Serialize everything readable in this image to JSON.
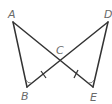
{
  "diagram": {
    "type": "geometry",
    "points": {
      "A": {
        "label": "A",
        "x": 13,
        "y": 22
      },
      "B": {
        "label": "B",
        "x": 27,
        "y": 87
      },
      "C": {
        "label": "C",
        "x": 60,
        "y": 61
      },
      "D": {
        "label": "D",
        "x": 108,
        "y": 22
      },
      "E": {
        "label": "E",
        "x": 93,
        "y": 87
      }
    },
    "segments": [
      "AB",
      "AE",
      "DB",
      "DE"
    ],
    "marks": {
      "congruent_segments": [
        "BC",
        "CE"
      ],
      "congruent_angles": [
        "B",
        "E"
      ]
    },
    "colors": {
      "line": "#333333",
      "label": "#6a6a6a"
    }
  }
}
